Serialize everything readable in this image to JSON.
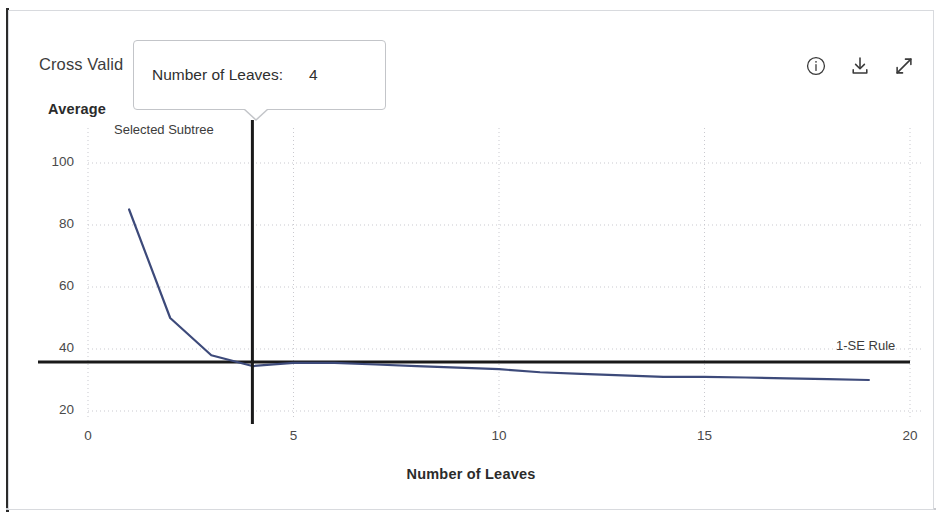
{
  "card": {
    "title": "Cross Valid",
    "title_full_visible": "Cross Valid"
  },
  "toolbar": {
    "info_label": "info-icon",
    "download_label": "download-icon",
    "expand_label": "expand-icon"
  },
  "tooltip": {
    "key": "Number of Leaves:",
    "value": "4"
  },
  "annotations": {
    "selected_subtree": "Selected Subtree",
    "se_rule": "1-SE Rule"
  },
  "colors": {
    "curve": "#3d4a7a",
    "rule_line": "#1a1a1a",
    "subtree_line": "#1a1a1a",
    "grid": "#c9c9cf",
    "card_border": "#d8dade"
  },
  "chart_data": {
    "type": "line",
    "title": "Cross Valid",
    "xlabel": "Number of Leaves",
    "ylabel": "Average",
    "xlim": [
      0,
      20
    ],
    "ylim": [
      16,
      107
    ],
    "xticks": [
      0,
      5,
      10,
      15,
      20
    ],
    "yticks": [
      20,
      40,
      60,
      80,
      100
    ],
    "grid": true,
    "legend": "none",
    "series": [
      {
        "name": "Cross Validation Error",
        "color": "#3d4a7a",
        "x": [
          1,
          2,
          3,
          4,
          5,
          6,
          7,
          8,
          9,
          10,
          11,
          12,
          13,
          14,
          15,
          16,
          17,
          18,
          19
        ],
        "values": [
          85,
          50,
          38,
          34.5,
          35.5,
          35.5,
          35,
          34.5,
          34,
          33.5,
          32.5,
          32,
          31.5,
          31,
          31,
          30.8,
          30.5,
          30.3,
          30
        ]
      }
    ],
    "reference_lines": [
      {
        "name": "1-SE Rule",
        "orientation": "horizontal",
        "value": 35.8,
        "color": "#1a1a1a",
        "label": "1-SE Rule",
        "label_position": "right"
      },
      {
        "name": "Selected Subtree",
        "orientation": "vertical",
        "value": 4,
        "color": "#1a1a1a",
        "label": "Selected Subtree",
        "label_position": "top-left"
      }
    ]
  }
}
